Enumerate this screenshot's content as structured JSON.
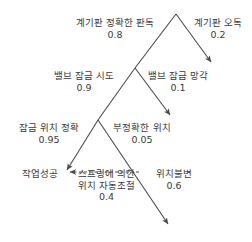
{
  "diagram": {
    "type": "event-tree",
    "title": "",
    "line_color": "#4a4a4a",
    "text_color": "#3a3a3a",
    "background": "#ffffff",
    "branches": [
      {
        "id": "branch-correct-reading",
        "label": "계기판 정확한 판독",
        "probability": "0.8",
        "side": "left",
        "level": 1
      },
      {
        "id": "branch-misreading",
        "label": "계기판 오독",
        "probability": "0.2",
        "side": "right",
        "level": 1
      },
      {
        "id": "branch-valve-lock-attempt",
        "label": "밸브 잠금 시도",
        "probability": "0.9",
        "side": "left",
        "level": 2
      },
      {
        "id": "branch-valve-lock-forgotten",
        "label": "밸브 잠금 망각",
        "probability": "0.1",
        "side": "right",
        "level": 2
      },
      {
        "id": "branch-lock-position-accurate",
        "label": "잠금 위치 정확",
        "probability": "0.95",
        "side": "left",
        "level": 3
      },
      {
        "id": "branch-lock-position-inaccurate",
        "label": "부정확한 위치",
        "probability": "0.05",
        "side": "right",
        "level": 3
      },
      {
        "id": "branch-spring-autoadjust",
        "label_line1": "스프링에 의한",
        "label_line2": "위치 자동조절",
        "probability": "0.4",
        "side": "left",
        "level": 4
      },
      {
        "id": "branch-position-unchanged",
        "label": "위치불변",
        "probability": "0.6",
        "side": "right",
        "level": 4
      }
    ],
    "outcomes": [
      {
        "id": "outcome-task-success",
        "label": "작업성공"
      }
    ]
  }
}
